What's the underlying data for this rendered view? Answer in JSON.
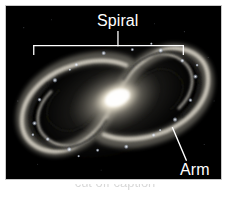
{
  "figure": {
    "kind": "labeled-photograph",
    "background_color": "#ffffff"
  },
  "photo": {
    "background_color": "#000000",
    "border_color": "#c9c9c9",
    "core_color": "#fffdf2",
    "inner_disk_color": "#d8d2c4",
    "mid_disk_color": "#8d897f",
    "arm_knot_color": "#eaf2ff",
    "dust_lane_color": "#2a2824"
  },
  "annotations": {
    "spiral": {
      "label": "Spiral",
      "color": "#ffffff",
      "leader_type": "bracket"
    },
    "arm": {
      "label": "Arm",
      "color": "#ffffff",
      "leader_type": "line"
    }
  },
  "caption": {
    "remnant_text": "cut off caption"
  }
}
